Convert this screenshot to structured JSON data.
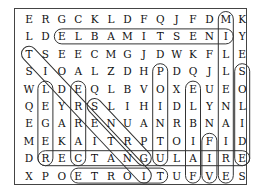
{
  "puzzle": {
    "type": "word-search",
    "cols": 14,
    "rows_count": 10,
    "rows": [
      "ERGCKLDFQJFDMK",
      "LDELBAMITSENIY",
      "TSEECMGJDWKFLE",
      "SIOALZDHPDQJLS",
      "WLDEQLBVOXEUEO",
      "QEYRSLIHIDLYNL",
      "EGARENUANRBNAI",
      "MEKAITRPTOIFID",
      "DRECTANGULAIRE",
      "XPOETROITUFVES"
    ],
    "found_words": [
      {
        "word": "INESTIMABLE",
        "from": [
          1,
          2
        ],
        "to": [
          1,
          12
        ]
      },
      {
        "word": "MILLENAIRE",
        "from": [
          0,
          12
        ],
        "to": [
          9,
          12
        ]
      },
      {
        "word": "SOLIDE",
        "from": [
          3,
          13
        ],
        "to": [
          8,
          13
        ]
      },
      {
        "word": "LEGER",
        "from": [
          4,
          1
        ],
        "to": [
          8,
          1
        ]
      },
      {
        "word": "CARRE",
        "from": [
          4,
          3
        ],
        "to": [
          8,
          3
        ]
      },
      {
        "word": "RECTANGULAIRE",
        "from": [
          8,
          1
        ],
        "to": [
          8,
          13
        ]
      },
      {
        "word": "ETROIT",
        "from": [
          9,
          3
        ],
        "to": [
          9,
          8
        ]
      },
      {
        "word": "INTERDIT",
        "from": [
          2,
          0
        ],
        "to": [
          9,
          7
        ]
      },
      {
        "word": "SORG",
        "from": [
          5,
          4
        ],
        "to": [
          8,
          7
        ]
      },
      {
        "word": "POINTU",
        "from": [
          3,
          8
        ],
        "to": [
          8,
          8
        ]
      },
      {
        "word": "FAIBLE",
        "from": [
          4,
          10
        ],
        "to": [
          9,
          10
        ]
      },
      {
        "word": "FIV",
        "from": [
          7,
          11
        ],
        "to": [
          9,
          11
        ]
      }
    ]
  }
}
